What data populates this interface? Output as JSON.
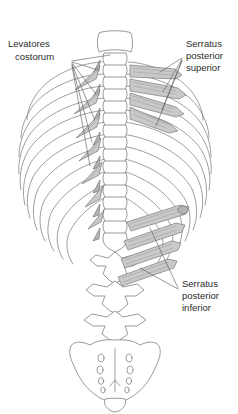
{
  "figure": {
    "background_color": "#ffffff",
    "line_color": "#6d6d6d",
    "muscle_fill": "#c9c9c9",
    "text_color": "#2b2b2b"
  },
  "labels": [
    {
      "id": "levatores-costarum",
      "line1": "Levatores",
      "line2": "costorum",
      "line3": "",
      "align": "left",
      "x": 8,
      "y": 47
    },
    {
      "id": "serratus-posterior-superior",
      "line1": "Serratus",
      "line2": "posterior",
      "line3": "superior",
      "align": "left",
      "x": 186,
      "y": 47
    },
    {
      "id": "serratus-posterior-inferior",
      "line1": "Serratus",
      "line2": "posterior",
      "line3": "inferior",
      "align": "left",
      "x": 182,
      "y": 287
    }
  ],
  "structures": {
    "spine": "vertebral column, cervical to sacrum",
    "ribs": "twelve paired ribs, posterior view",
    "sacrum": "sacrum with four paired sacral foramina",
    "coccyx": "coccyx"
  },
  "muscle_groups": [
    {
      "name": "levatores costarum",
      "side": "left",
      "count": 7,
      "shape": "triangular slips"
    },
    {
      "name": "serratus posterior superior",
      "side": "right-upper",
      "count": 4,
      "shape": "tapering bands"
    },
    {
      "name": "serratus posterior inferior",
      "side": "right-lower",
      "count": 4,
      "shape": "elongated bands"
    }
  ]
}
